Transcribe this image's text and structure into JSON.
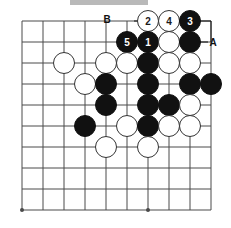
{
  "diagram": {
    "board": {
      "grid": {
        "columns": 10,
        "rows": 10,
        "x_origin": 22,
        "y_origin": 21,
        "spacing": 21,
        "line_color": "#4a4a4a",
        "board_color": "#ffffff"
      },
      "star_points": [
        {
          "col": 0,
          "row": 9
        },
        {
          "col": 6,
          "row": 9
        }
      ],
      "edges": {
        "top_row_index": 0,
        "right_col_index": 9
      }
    },
    "colors": {
      "black_stone": "#111111",
      "white_stone": "#ffffff",
      "stone_outline": "#333333",
      "label_black_text": "#ffffff",
      "label_white_text": "#1a1a1a",
      "grid_line": "#4a4a4a",
      "top_strip": "#b9b9b9"
    },
    "stones": [
      {
        "id": "w-c6-r0",
        "color": "white",
        "col": 6,
        "row": 0,
        "label": "2"
      },
      {
        "id": "w-c7-r0",
        "color": "white",
        "col": 7,
        "row": 0,
        "label": "4"
      },
      {
        "id": "b-c8-r0",
        "color": "black",
        "col": 8,
        "row": 0,
        "label": "3"
      },
      {
        "id": "b-c5-r1",
        "color": "black",
        "col": 5,
        "row": 1,
        "label": "5"
      },
      {
        "id": "b-c6-r1",
        "color": "black",
        "col": 6,
        "row": 1,
        "label": "1"
      },
      {
        "id": "w-c7-r1",
        "color": "white",
        "col": 7,
        "row": 1,
        "label": ""
      },
      {
        "id": "b-c8-r1",
        "color": "black",
        "col": 8,
        "row": 1,
        "label": ""
      },
      {
        "id": "w-c2-r2",
        "color": "white",
        "col": 2,
        "row": 2,
        "label": ""
      },
      {
        "id": "w-c4-r2",
        "color": "white",
        "col": 4,
        "row": 2,
        "label": ""
      },
      {
        "id": "w-c5-r2",
        "color": "white",
        "col": 5,
        "row": 2,
        "label": ""
      },
      {
        "id": "b-c6-r2",
        "color": "black",
        "col": 6,
        "row": 2,
        "label": ""
      },
      {
        "id": "w-c7-r2",
        "color": "white",
        "col": 7,
        "row": 2,
        "label": ""
      },
      {
        "id": "w-c8-r2",
        "color": "white",
        "col": 8,
        "row": 2,
        "label": ""
      },
      {
        "id": "w-c3-r3",
        "color": "white",
        "col": 3,
        "row": 3,
        "label": ""
      },
      {
        "id": "b-c4-r3",
        "color": "black",
        "col": 4,
        "row": 3,
        "label": ""
      },
      {
        "id": "b-c6-r3",
        "color": "black",
        "col": 6,
        "row": 3,
        "label": ""
      },
      {
        "id": "b-c8-r3",
        "color": "black",
        "col": 8,
        "row": 3,
        "label": ""
      },
      {
        "id": "b-c9-r3",
        "color": "black",
        "col": 9,
        "row": 3,
        "label": ""
      },
      {
        "id": "b-c4-r4",
        "color": "black",
        "col": 4,
        "row": 4,
        "label": ""
      },
      {
        "id": "b-c6-r4",
        "color": "black",
        "col": 6,
        "row": 4,
        "label": ""
      },
      {
        "id": "b-c7-r4",
        "color": "black",
        "col": 7,
        "row": 4,
        "label": ""
      },
      {
        "id": "w-c8-r4",
        "color": "white",
        "col": 8,
        "row": 4,
        "label": ""
      },
      {
        "id": "b-c3-r5",
        "color": "black",
        "col": 3,
        "row": 5,
        "label": ""
      },
      {
        "id": "w-c5-r5",
        "color": "white",
        "col": 5,
        "row": 5,
        "label": ""
      },
      {
        "id": "b-c6-r5",
        "color": "black",
        "col": 6,
        "row": 5,
        "label": ""
      },
      {
        "id": "w-c7-r5",
        "color": "white",
        "col": 7,
        "row": 5,
        "label": ""
      },
      {
        "id": "w-c8-r5",
        "color": "white",
        "col": 8,
        "row": 5,
        "label": ""
      },
      {
        "id": "w-c4-r6",
        "color": "white",
        "col": 4,
        "row": 6,
        "label": ""
      },
      {
        "id": "w-c6-r6",
        "color": "white",
        "col": 6,
        "row": 6,
        "label": ""
      }
    ],
    "coordinate_markers": [
      {
        "id": "marker-b",
        "text": "B",
        "col": 5,
        "row": 0,
        "offset_x": -20,
        "offset_y": -2
      },
      {
        "id": "marker-a",
        "text": "A",
        "col": 9,
        "row": 1,
        "offset_x": 2,
        "offset_y": 0
      }
    ],
    "marker_lines": [
      {
        "id": "line-b",
        "x1": 134,
        "y1": 21,
        "x2": 145,
        "y2": 21
      },
      {
        "id": "line-a-horizontal",
        "x1": 200,
        "y1": 42,
        "x2": 208,
        "y2": 42
      },
      {
        "id": "line-a-vertical",
        "x1": 211,
        "y1": 21,
        "x2": 211,
        "y2": 42
      },
      {
        "id": "line-a-top",
        "x1": 196,
        "y1": 21,
        "x2": 211,
        "y2": 21
      }
    ]
  }
}
